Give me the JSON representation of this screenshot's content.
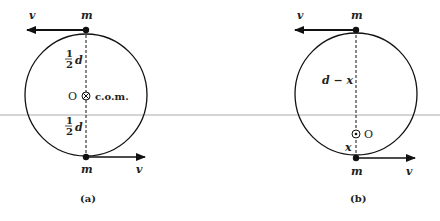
{
  "figure": {
    "panels": [
      {
        "caption": "(a)",
        "top_mass": "m",
        "bottom_mass": "m",
        "top_velocity": "v",
        "bottom_velocity": "v",
        "upper_distance": "d",
        "lower_distance": "d",
        "fraction_num": "1",
        "fraction_den": "2",
        "origin": "O",
        "origin_symbol": "⊗",
        "com_label": "c.o.m."
      },
      {
        "caption": "(b)",
        "top_mass": "m",
        "bottom_mass": "m",
        "top_velocity": "v",
        "bottom_velocity": "v",
        "upper_distance": "d − x",
        "lower_distance": "x",
        "origin": "O",
        "origin_symbol": "⊙"
      }
    ]
  }
}
